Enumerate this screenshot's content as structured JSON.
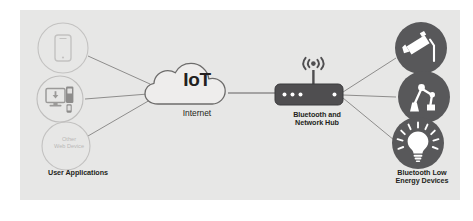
{
  "diagram": {
    "background_color": "#e7e7e6",
    "line_color": "#8e8d8c",
    "dark_fill": "#58585a",
    "text_color": "#231f20",
    "faint_text_color": "#b9b8b7"
  },
  "left_group": {
    "label": "User Applications",
    "nodes": [
      {
        "id": "smartphone",
        "icon": "smartphone-icon",
        "label": ""
      },
      {
        "id": "desktop",
        "icon": "desktop-computer-icon",
        "label": ""
      },
      {
        "id": "other-web-device",
        "icon": "",
        "label": "Other\nWeb Device"
      }
    ]
  },
  "cloud": {
    "title": "IoT",
    "subtitle": "Internet",
    "icon": "cloud-icon"
  },
  "hub": {
    "label": "Bluetooth and\nNetwork Hub",
    "icon": "network-hub-icon",
    "antenna_icon": "wifi-antenna-icon",
    "led_count_left": 3,
    "led_count_right": 1
  },
  "right_group": {
    "label": "Bluetooth Low\nEnergy Devices",
    "nodes": [
      {
        "id": "security-camera",
        "icon": "security-camera-icon"
      },
      {
        "id": "robotic-arm",
        "icon": "robotic-arm-icon"
      },
      {
        "id": "smart-lightbulb",
        "icon": "lightbulb-icon"
      }
    ]
  },
  "connections": [
    {
      "from": "smartphone",
      "to": "cloud"
    },
    {
      "from": "desktop",
      "to": "cloud"
    },
    {
      "from": "other-web-device",
      "to": "cloud"
    },
    {
      "from": "cloud",
      "to": "hub"
    },
    {
      "from": "hub",
      "to": "security-camera"
    },
    {
      "from": "hub",
      "to": "robotic-arm"
    },
    {
      "from": "hub",
      "to": "smart-lightbulb"
    }
  ]
}
